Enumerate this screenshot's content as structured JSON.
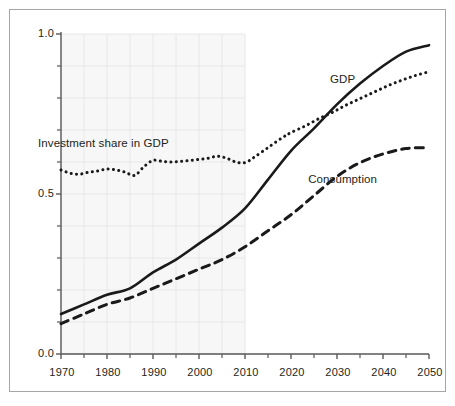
{
  "chart_data": {
    "type": "line",
    "title": "",
    "subtitle": "",
    "xlabel": "",
    "ylabel": "",
    "xlim": [
      1970,
      2050
    ],
    "ylim": [
      0.0,
      1.0
    ],
    "grid": true,
    "grid_region": {
      "note": "light shaded grid panel over historical period",
      "x_start": 1970,
      "x_end": 2010,
      "color": "#f7f7f7"
    },
    "legend_position": "inline-annotations",
    "x_tick_labels": [
      "1970",
      "1980",
      "1990",
      "2000",
      "2010",
      "2020",
      "2030",
      "2040",
      "2050"
    ],
    "x_tick_values": [
      1970,
      1980,
      1990,
      2000,
      2010,
      2020,
      2030,
      2040,
      2050
    ],
    "x_minor_ticks": [
      1975,
      1985,
      1995,
      2005,
      2015,
      2025,
      2035,
      2045
    ],
    "y_tick_labels": [
      "0.0",
      "0.5",
      "1.0"
    ],
    "y_tick_values": [
      0.0,
      0.5,
      1.0
    ],
    "y_minor_ticks": [
      0.1,
      0.2,
      0.3,
      0.4,
      0.6,
      0.7,
      0.8,
      0.9
    ],
    "series": [
      {
        "name": "GDP",
        "style": "solid",
        "color": "#1a1a1a",
        "width": 2.6,
        "label_text": "GDP",
        "label_x": 2031,
        "label_y": 0.855,
        "x": [
          1970,
          1975,
          1980,
          1985,
          1990,
          1995,
          2000,
          2005,
          2010,
          2015,
          2020,
          2025,
          2030,
          2035,
          2040,
          2045,
          2050
        ],
        "y": [
          0.125,
          0.155,
          0.185,
          0.205,
          0.255,
          0.295,
          0.345,
          0.395,
          0.455,
          0.545,
          0.635,
          0.705,
          0.78,
          0.845,
          0.9,
          0.945,
          0.965
        ]
      },
      {
        "name": "Investment share in GDP",
        "style": "dotted",
        "color": "#1a1a1a",
        "width": 3.0,
        "label_text": "Investment share in GDP",
        "label_x": 1979,
        "label_y": 0.655,
        "x": [
          1970,
          1972,
          1974,
          1976,
          1978,
          1980,
          1982,
          1984,
          1986,
          1988,
          1990,
          1992,
          1994,
          1996,
          1998,
          2000,
          2002,
          2004,
          2006,
          2008,
          2010,
          2012,
          2015,
          2018,
          2020,
          2023,
          2026,
          2029,
          2032,
          2035,
          2038,
          2041,
          2044,
          2047,
          2050
        ],
        "y": [
          0.575,
          0.565,
          0.562,
          0.568,
          0.572,
          0.578,
          0.575,
          0.568,
          0.558,
          0.585,
          0.605,
          0.602,
          0.6,
          0.602,
          0.605,
          0.608,
          0.612,
          0.618,
          0.612,
          0.6,
          0.598,
          0.615,
          0.645,
          0.675,
          0.692,
          0.712,
          0.735,
          0.755,
          0.778,
          0.798,
          0.818,
          0.838,
          0.855,
          0.87,
          0.882
        ]
      },
      {
        "name": "Consumption",
        "style": "dashed",
        "color": "#1a1a1a",
        "width": 3.0,
        "label_text": "Consumption",
        "label_x": 2031,
        "label_y": 0.545,
        "x": [
          1970,
          1975,
          1980,
          1985,
          1990,
          1995,
          2000,
          2005,
          2010,
          2015,
          2020,
          2025,
          2030,
          2035,
          2040,
          2045,
          2050
        ],
        "y": [
          0.095,
          0.125,
          0.155,
          0.175,
          0.205,
          0.235,
          0.265,
          0.295,
          0.335,
          0.385,
          0.435,
          0.495,
          0.555,
          0.598,
          0.625,
          0.642,
          0.645
        ]
      }
    ]
  },
  "axes": {
    "y_labels": [
      {
        "text": "1.0",
        "value": 1.0
      },
      {
        "text": "0.5",
        "value": 0.5
      },
      {
        "text": "0.0",
        "value": 0.0
      }
    ],
    "x_labels": [
      {
        "text": "1970",
        "value": 1970
      },
      {
        "text": "1980",
        "value": 1980
      },
      {
        "text": "1990",
        "value": 1990
      },
      {
        "text": "2000",
        "value": 2000
      },
      {
        "text": "2010",
        "value": 2010
      },
      {
        "text": "2020",
        "value": 2020
      },
      {
        "text": "2030",
        "value": 2030
      },
      {
        "text": "2040",
        "value": 2040
      },
      {
        "text": "2050",
        "value": 2050
      }
    ]
  },
  "annotations": [
    {
      "id": "gdp",
      "text": "GDP"
    },
    {
      "id": "investment",
      "text": "Investment share in GDP"
    },
    {
      "id": "consumption",
      "text": "Consumption"
    }
  ],
  "colors": {
    "frame_border": "#a6a6a6",
    "axis_line": "#595959",
    "grid_line": "#e8e8e8",
    "panel_fill": "#f7f7f7",
    "series_ink": "#1a1a1a",
    "text": "#231f20",
    "background": "#ffffff"
  }
}
